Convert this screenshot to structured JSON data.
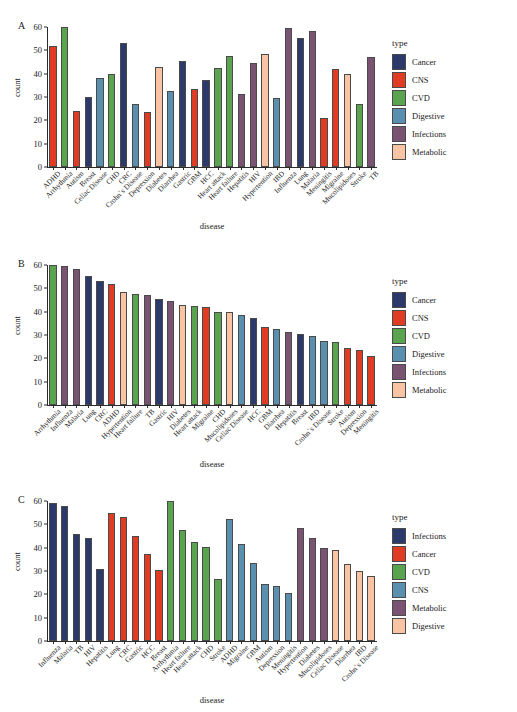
{
  "figure": {
    "panels": [
      "A",
      "B",
      "C"
    ],
    "axis": {
      "ylabel": "count",
      "xlabel": "disease",
      "yticks": [
        0,
        10,
        20,
        30,
        40,
        50,
        60
      ],
      "ylim": [
        0,
        60
      ]
    },
    "legend_title": "type"
  },
  "palette": {
    "navy": "#2b3a6b",
    "red": "#e03c24",
    "green": "#5aa450",
    "blue": "#5b8fb0",
    "purple": "#7a5373",
    "peach": "#f8c4a4"
  },
  "chart_data": [
    {
      "type": "bar",
      "panel": "A",
      "title": "A",
      "xlabel": "disease",
      "ylabel": "count",
      "ylim": [
        0,
        60
      ],
      "yticks": [
        0,
        10,
        20,
        30,
        40,
        50,
        60
      ],
      "grid": false,
      "legend_position": "right",
      "legend_title": "type",
      "legend_entries": [
        {
          "label": "Cancer",
          "color": "#2b3a6b"
        },
        {
          "label": "CNS",
          "color": "#e03c24"
        },
        {
          "label": "CVD",
          "color": "#5aa450"
        },
        {
          "label": "Digestive",
          "color": "#5b8fb0"
        },
        {
          "label": "Infections",
          "color": "#7a5373"
        },
        {
          "label": "Metabolic",
          "color": "#f8c4a4"
        }
      ],
      "categories": [
        "ADHD",
        "Arrhythmia",
        "Autism",
        "Breast",
        "Celiac Disease",
        "CHD",
        "CRC",
        "Crohn`s Disease",
        "Depression",
        "Diabetes",
        "Diarrhea",
        "Gastric",
        "GBM",
        "HCC",
        "Heart attack",
        "Heart failure",
        "Hepatitis",
        "HIV",
        "Hypertention",
        "IBD",
        "Influenza",
        "Lung",
        "Malaria",
        "Meningitis",
        "Migraine",
        "Mucolipidoses",
        "Stroke",
        "TB"
      ],
      "values": [
        52,
        60,
        24,
        30,
        38,
        40,
        53,
        27,
        23.5,
        43,
        32.5,
        45.5,
        33.5,
        37.5,
        42.5,
        47.5,
        31.5,
        44.5,
        48.5,
        29.5,
        59.5,
        55.5,
        58.5,
        21,
        42,
        40,
        27,
        47
      ],
      "colors": [
        "#e03c24",
        "#5aa450",
        "#e03c24",
        "#2b3a6b",
        "#5b8fb0",
        "#5aa450",
        "#2b3a6b",
        "#5b8fb0",
        "#e03c24",
        "#f8c4a4",
        "#5b8fb0",
        "#2b3a6b",
        "#e03c24",
        "#2b3a6b",
        "#5aa450",
        "#5aa450",
        "#7a5373",
        "#7a5373",
        "#f8c4a4",
        "#5b8fb0",
        "#7a5373",
        "#2b3a6b",
        "#7a5373",
        "#e03c24",
        "#e03c24",
        "#f8c4a4",
        "#5aa450",
        "#7a5373"
      ]
    },
    {
      "type": "bar",
      "panel": "B",
      "title": "B",
      "xlabel": "disease",
      "ylabel": "count",
      "ylim": [
        0,
        60
      ],
      "yticks": [
        0,
        10,
        20,
        30,
        40,
        50,
        60
      ],
      "grid": false,
      "legend_position": "right",
      "legend_title": "type",
      "legend_entries": [
        {
          "label": "Cancer",
          "color": "#2b3a6b"
        },
        {
          "label": "CNS",
          "color": "#e03c24"
        },
        {
          "label": "CVD",
          "color": "#5aa450"
        },
        {
          "label": "Digestive",
          "color": "#5b8fb0"
        },
        {
          "label": "Infections",
          "color": "#7a5373"
        },
        {
          "label": "Metabolic",
          "color": "#f8c4a4"
        }
      ],
      "categories": [
        "Arrhythmia",
        "Influenza",
        "Malaria",
        "Lung",
        "CRC",
        "ADHD",
        "Hypertention",
        "Heart failure",
        "TB",
        "Gastric",
        "HIV",
        "Diabetes",
        "Heart attack",
        "Migraine",
        "CHD",
        "Mucolipidoses",
        "Celiac Disease",
        "HCC",
        "GBM",
        "Diarrhea",
        "Hepatitis",
        "Breast",
        "IBD",
        "Crohn`s Disease",
        "Stroke",
        "Autism",
        "Depression",
        "Meningitis"
      ],
      "values": [
        60,
        59.5,
        58.5,
        55.5,
        53,
        52,
        48.5,
        47.5,
        47,
        45.5,
        44.5,
        43,
        42.5,
        42,
        40,
        40,
        38.5,
        37.5,
        33.5,
        32.5,
        31.5,
        30.5,
        29.5,
        27.5,
        27,
        24.5,
        23.5,
        21
      ],
      "colors": [
        "#5aa450",
        "#7a5373",
        "#7a5373",
        "#2b3a6b",
        "#2b3a6b",
        "#e03c24",
        "#f8c4a4",
        "#5aa450",
        "#7a5373",
        "#2b3a6b",
        "#7a5373",
        "#f8c4a4",
        "#5aa450",
        "#e03c24",
        "#5aa450",
        "#f8c4a4",
        "#5b8fb0",
        "#2b3a6b",
        "#e03c24",
        "#5b8fb0",
        "#7a5373",
        "#2b3a6b",
        "#5b8fb0",
        "#5b8fb0",
        "#5aa450",
        "#e03c24",
        "#e03c24",
        "#e03c24"
      ]
    },
    {
      "type": "bar",
      "panel": "C",
      "title": "C",
      "xlabel": "disease",
      "ylabel": "count",
      "ylim": [
        0,
        60
      ],
      "yticks": [
        0,
        10,
        20,
        30,
        40,
        50,
        60
      ],
      "grid": false,
      "legend_position": "right",
      "legend_title": "type",
      "legend_entries": [
        {
          "label": "Infections",
          "color": "#2b3a6b"
        },
        {
          "label": "Cancer",
          "color": "#e03c24"
        },
        {
          "label": "CVD",
          "color": "#5aa450"
        },
        {
          "label": "CNS",
          "color": "#5b8fb0"
        },
        {
          "label": "Metabolic",
          "color": "#7a5373"
        },
        {
          "label": "Digestive",
          "color": "#f8c4a4"
        }
      ],
      "categories": [
        "Influenza",
        "Malaria",
        "TB",
        "HIV",
        "Hepatitis",
        "Lung",
        "CRC",
        "Gastric",
        "HCC",
        "Breast",
        "Arrhythmia",
        "Heart failure",
        "Heart attack",
        "CHD",
        "Stroke",
        "ADHD",
        "Migraine",
        "GBM",
        "Autism",
        "Depression",
        "Meningitis",
        "Hypertention",
        "Diabetes",
        "Mucolipidoses",
        "Celiac Disease",
        "Diarrhea",
        "IBD",
        "Crohn`s Disease"
      ],
      "values": [
        59,
        58,
        46,
        44,
        31,
        55,
        53,
        45,
        37.5,
        30.5,
        60,
        47.5,
        42.5,
        40.5,
        26.5,
        52.5,
        41.5,
        33.5,
        24.5,
        23.5,
        20.5,
        48.5,
        44,
        40,
        39,
        33,
        30,
        28
      ],
      "colors": [
        "#2b3a6b",
        "#2b3a6b",
        "#2b3a6b",
        "#2b3a6b",
        "#2b3a6b",
        "#e03c24",
        "#e03c24",
        "#e03c24",
        "#e03c24",
        "#e03c24",
        "#5aa450",
        "#5aa450",
        "#5aa450",
        "#5aa450",
        "#5aa450",
        "#5b8fb0",
        "#5b8fb0",
        "#5b8fb0",
        "#5b8fb0",
        "#5b8fb0",
        "#5b8fb0",
        "#7a5373",
        "#7a5373",
        "#7a5373",
        "#f8c4a4",
        "#f8c4a4",
        "#f8c4a4",
        "#f8c4a4"
      ]
    }
  ]
}
